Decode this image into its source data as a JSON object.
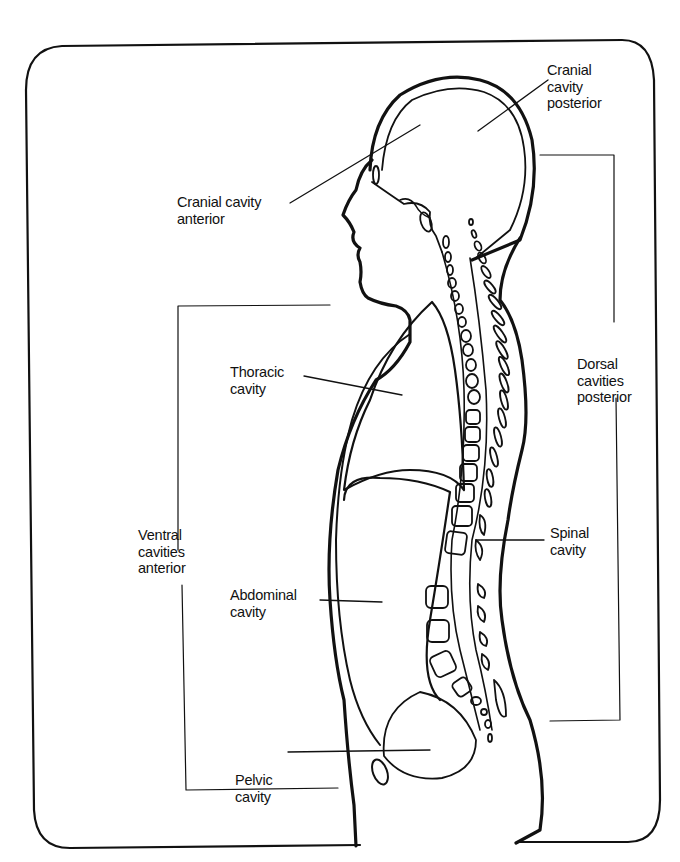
{
  "diagram": {
    "type": "anatomical-sagittal-section",
    "colors": {
      "line": "#111111",
      "background": "#ffffff"
    },
    "labels": {
      "cranial_posterior": [
        "Cranial",
        "cavity",
        "posterior"
      ],
      "cranial_anterior": [
        "Cranial cavity",
        "anterior"
      ],
      "thoracic": [
        "Thoracic",
        "cavity"
      ],
      "dorsal": [
        "Dorsal",
        "cavities",
        "posterior"
      ],
      "ventral": [
        "Ventral",
        "cavities",
        "anterior"
      ],
      "spinal": [
        "Spinal",
        "cavity"
      ],
      "abdominal": [
        "Abdominal",
        "cavity"
      ],
      "pelvic": [
        "Pelvic",
        "cavity"
      ]
    }
  }
}
